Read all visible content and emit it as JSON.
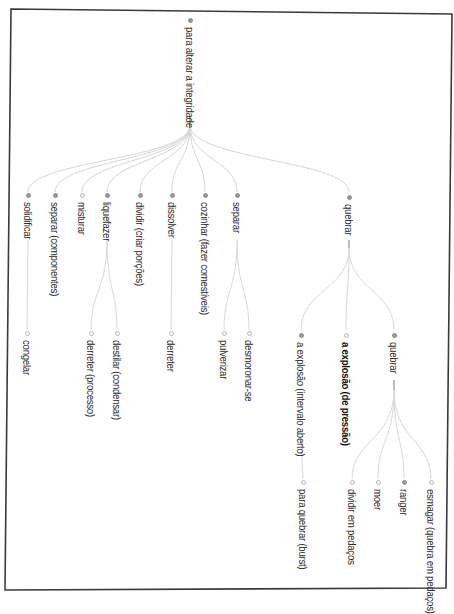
{
  "diagram": {
    "orientation": "rotated-90-clockwise",
    "colors": {
      "border": "#3a3a3a",
      "link": "#d6d6d6",
      "node_filled": "#9a9a9a",
      "node_hollow": "#ffffff",
      "text": "#2a2a2a"
    },
    "root": {
      "label": "para alterar a integridade",
      "node": "filled"
    },
    "level1": [
      {
        "label": "solidificar",
        "node": "filled"
      },
      {
        "label": "separar (componentes)",
        "node": "filled"
      },
      {
        "label": "misturar",
        "node": "hollow"
      },
      {
        "label": "liquefazer",
        "node": "filled"
      },
      {
        "label": "dividir (criar porções)",
        "node": "filled"
      },
      {
        "label": "dissolver",
        "node": "filled"
      },
      {
        "label": "cozinhar (fazer comestíveis)",
        "node": "filled"
      },
      {
        "label": "separar",
        "node": "filled"
      },
      {
        "label": "quebrar",
        "node": "filled"
      }
    ],
    "level2": [
      {
        "label": "congelar",
        "parent": "solidificar",
        "node": "hollow"
      },
      {
        "label": "derreter (processo)",
        "parent": "liquefazer",
        "node": "hollow"
      },
      {
        "label": "destilar (condensar)",
        "parent": "liquefazer",
        "node": "hollow"
      },
      {
        "label": "derreter",
        "parent": "dissolver",
        "node": "hollow"
      },
      {
        "label": "pulverizar",
        "parent": "separar",
        "node": "hollow"
      },
      {
        "label": "desmoronar-se",
        "parent": "separar",
        "node": "hollow"
      },
      {
        "label": "a explosão (intervalo aberto)",
        "parent": "quebrar",
        "node": "filled"
      },
      {
        "label": "a explosão (de pressão)",
        "parent": "quebrar",
        "node": "hollow",
        "bold": true
      },
      {
        "label": "quebrar",
        "parent": "quebrar",
        "node": "filled"
      }
    ],
    "level3": [
      {
        "label": "para quebrar (burst)",
        "parent": "a explosão (intervalo aberto)",
        "node": "hollow"
      },
      {
        "label": "dividir em pedaços",
        "parent": "quebrar",
        "node": "hollow"
      },
      {
        "label": "moer",
        "parent": "quebrar",
        "node": "hollow"
      },
      {
        "label": "ranger",
        "parent": "quebrar",
        "node": "filled"
      },
      {
        "label": "esmagar (quebra em pedaços)",
        "parent": "quebrar",
        "node": "hollow"
      }
    ]
  }
}
